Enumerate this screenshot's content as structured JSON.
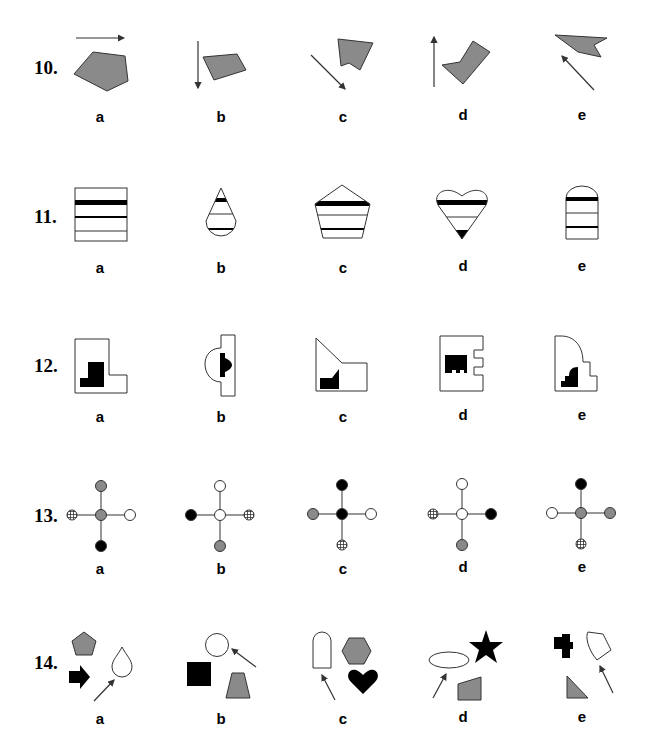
{
  "colors": {
    "gray_fill": "#8a8a8a",
    "black": "#000000",
    "white": "#ffffff",
    "stroke": "#333333"
  },
  "questions": [
    {
      "number": "10.",
      "options": [
        {
          "label": "a",
          "description": "gray pentagon with arrow pointing right above it"
        },
        {
          "label": "b",
          "description": "gray quadrilateral with arrow pointing down to its left"
        },
        {
          "label": "c",
          "description": "gray notched pentagon with arrow pointing down-right"
        },
        {
          "label": "d",
          "description": "gray L/chevron shape with arrow pointing up to its left"
        },
        {
          "label": "e",
          "description": "gray notched flag shape with arrow pointing up-left below it"
        }
      ]
    },
    {
      "number": "11.",
      "options": [
        {
          "label": "a",
          "description": "square with horizontal stripes (thick, medium, thin)"
        },
        {
          "label": "b",
          "description": "teardrop with black tip band and stripes"
        },
        {
          "label": "c",
          "description": "pentagon with horizontal stripes"
        },
        {
          "label": "d",
          "description": "heart with horizontal stripes and black bottom tip"
        },
        {
          "label": "e",
          "description": "arch-topped rectangle with horizontal stripes"
        }
      ]
    },
    {
      "number": "12.",
      "options": [
        {
          "label": "a",
          "description": "L-shaped outline with black stepped block"
        },
        {
          "label": "b",
          "description": "tall bar with semicircular bump and black notched block"
        },
        {
          "label": "c",
          "description": "slanted-top outline with black sloped block"
        },
        {
          "label": "d",
          "description": "outline with two notches and black comb block"
        },
        {
          "label": "e",
          "description": "rounded-corner stepped outline with black stepped block"
        }
      ]
    },
    {
      "number": "13.",
      "options": [
        {
          "label": "a",
          "center": "gray",
          "top": "gray",
          "right": "white",
          "bottom": "black",
          "left": "hatched"
        },
        {
          "label": "b",
          "center": "white",
          "top": "white",
          "right": "hatched",
          "bottom": "gray",
          "left": "black"
        },
        {
          "label": "c",
          "center": "black",
          "top": "black",
          "right": "white",
          "bottom": "hatched",
          "left": "gray"
        },
        {
          "label": "d",
          "center": "white",
          "top": "white",
          "right": "black",
          "bottom": "gray",
          "left": "hatched"
        },
        {
          "label": "e",
          "center": "gray",
          "top": "black",
          "right": "gray",
          "bottom": "hatched",
          "left": "white"
        }
      ]
    },
    {
      "number": "14.",
      "options": [
        {
          "label": "a",
          "description": "gray pentagon, black arrow, white teardrop pointed to by arrow"
        },
        {
          "label": "b",
          "description": "white circle pointed to by arrow, black square, gray trapezoid"
        },
        {
          "label": "c",
          "description": "white arch pointed to by arrow, gray hexagon, black heart"
        },
        {
          "label": "d",
          "description": "white ellipse pointed to by arrow, black star, gray quadrilateral"
        },
        {
          "label": "e",
          "description": "black cross, white irregular shape pointed to by arrow, gray triangle"
        }
      ]
    }
  ]
}
